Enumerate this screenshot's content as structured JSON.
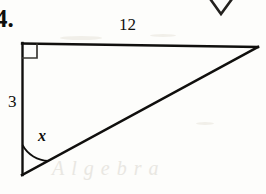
{
  "figure": {
    "problem_number": "4.",
    "type": "right-triangle",
    "stroke_color": "#100f0d",
    "background_color": "#fdfdfb",
    "labels": {
      "top_side": "12",
      "left_side": "3",
      "angle": "x"
    },
    "watermark_text": "Algebra",
    "geometry": {
      "vertex_top_left": [
        22,
        43
      ],
      "vertex_top_right": [
        258,
        47
      ],
      "vertex_bottom_left": [
        22,
        175
      ],
      "right_angle_marker_size": 14,
      "angle_arc_radius": 30
    },
    "artifact": {
      "name": "partial-triangle-above",
      "points": "198,-18 221,14 243,-16"
    }
  }
}
